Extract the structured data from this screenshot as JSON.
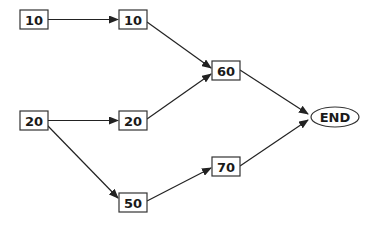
{
  "diagram": {
    "type": "network-flow",
    "stroke_color": "#222222",
    "background": "#ffffff",
    "nodes": [
      {
        "id": "a",
        "label": "10",
        "shape": "rect",
        "x": 20,
        "y": 10,
        "w": 28,
        "h": 19
      },
      {
        "id": "b",
        "label": "10",
        "shape": "rect",
        "x": 119,
        "y": 10,
        "w": 28,
        "h": 19
      },
      {
        "id": "c",
        "label": "60",
        "shape": "rect",
        "x": 212,
        "y": 61,
        "w": 28,
        "h": 19
      },
      {
        "id": "d",
        "label": "20",
        "shape": "rect",
        "x": 20,
        "y": 111,
        "w": 28,
        "h": 19
      },
      {
        "id": "e",
        "label": "20",
        "shape": "rect",
        "x": 119,
        "y": 111,
        "w": 28,
        "h": 19
      },
      {
        "id": "f",
        "label": "50",
        "shape": "rect",
        "x": 119,
        "y": 193,
        "w": 28,
        "h": 19
      },
      {
        "id": "g",
        "label": "70",
        "shape": "rect",
        "x": 212,
        "y": 157,
        "w": 28,
        "h": 19
      },
      {
        "id": "end",
        "label": "END",
        "shape": "ellipse",
        "cx": 335,
        "cy": 117,
        "rx": 24,
        "ry": 10
      }
    ],
    "edges": [
      {
        "from": "a",
        "to": "b"
      },
      {
        "from": "b",
        "to": "c"
      },
      {
        "from": "d",
        "to": "e"
      },
      {
        "from": "d",
        "to": "f"
      },
      {
        "from": "e",
        "to": "c"
      },
      {
        "from": "c",
        "to": "end"
      },
      {
        "from": "f",
        "to": "g"
      },
      {
        "from": "g",
        "to": "end"
      }
    ]
  }
}
